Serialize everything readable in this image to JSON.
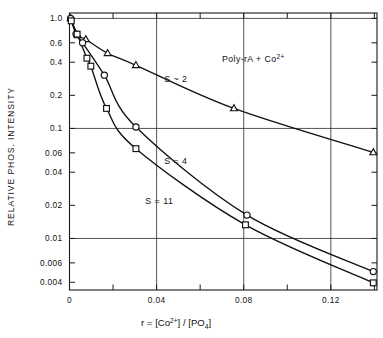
{
  "chart_data": {
    "type": "line",
    "title": "",
    "annotation": "Poly-rA + Co2+",
    "annotation_parts": {
      "pre": "Poly-rA + Co",
      "sup": "2+"
    },
    "xlabel_parts": {
      "pre": "r = [Co",
      "sup": "2+",
      "mid": "] / [PO",
      "sub": "4",
      "post": "]"
    },
    "xlabel": "r = [Co2+]/[PO4]",
    "ylabel": "RELATIVE PHOS. INTENSITY",
    "yscale": "log",
    "xscale": "linear",
    "xlim": [
      0,
      0.1412
    ],
    "ylim": [
      0.0034,
      1.12
    ],
    "grid": "major-only",
    "legend_position": "inline-labels",
    "xticks_major": [
      "0",
      "0.04",
      "0.08",
      "0.12"
    ],
    "xtick_major_values": [
      0,
      0.04,
      0.08,
      0.12
    ],
    "xtick_minor_values": [
      0.02,
      0.06,
      0.1,
      0.14
    ],
    "yticks": [
      "1.0",
      "0.6",
      "0.4",
      "0.2",
      "0.1",
      "0.06",
      "0.04",
      "0.02",
      "0.01",
      "0.006",
      "0.004"
    ],
    "ytick_values": [
      1.0,
      0.6,
      0.4,
      0.2,
      0.1,
      0.06,
      0.04,
      0.02,
      0.01,
      0.006,
      0.004
    ],
    "ygrid_values": [
      1.0,
      0.1,
      0.01
    ],
    "xgrid_values": [
      0.04,
      0.08,
      0.12
    ],
    "series": [
      {
        "name": "S ~ 2",
        "label": "S ~ 2",
        "marker": "triangle",
        "label_x": 0.0435,
        "label_y": 0.265,
        "points": [
          {
            "x": 0.0005,
            "y": 1.0
          },
          {
            "x": 0.0038,
            "y": 0.7
          },
          {
            "x": 0.0075,
            "y": 0.645
          },
          {
            "x": 0.0175,
            "y": 0.482
          },
          {
            "x": 0.0305,
            "y": 0.375
          },
          {
            "x": 0.0755,
            "y": 0.152
          },
          {
            "x": 0.1395,
            "y": 0.0605
          }
        ]
      },
      {
        "name": "S = 4",
        "label": "S = 4",
        "marker": "circle",
        "label_x": 0.0435,
        "label_y": 0.0475,
        "points": [
          {
            "x": 0.0005,
            "y": 1.0
          },
          {
            "x": 0.003,
            "y": 0.72
          },
          {
            "x": 0.006,
            "y": 0.6
          },
          {
            "x": 0.016,
            "y": 0.305
          },
          {
            "x": 0.0305,
            "y": 0.103
          },
          {
            "x": 0.0815,
            "y": 0.0163
          },
          {
            "x": 0.1395,
            "y": 0.005
          }
        ]
      },
      {
        "name": "S = 11",
        "label": "S = 11",
        "marker": "square",
        "label_x": 0.0348,
        "label_y": 0.0205,
        "points": [
          {
            "x": 0.0008,
            "y": 0.95
          },
          {
            "x": 0.0035,
            "y": 0.72
          },
          {
            "x": 0.008,
            "y": 0.435
          },
          {
            "x": 0.0098,
            "y": 0.368
          },
          {
            "x": 0.017,
            "y": 0.152
          },
          {
            "x": 0.0305,
            "y": 0.0655
          },
          {
            "x": 0.0808,
            "y": 0.0133
          },
          {
            "x": 0.1395,
            "y": 0.00395
          }
        ]
      }
    ]
  }
}
